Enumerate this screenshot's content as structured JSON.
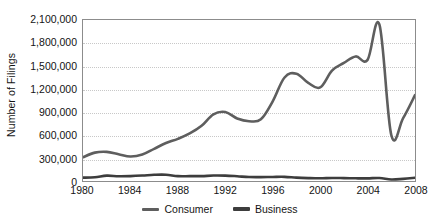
{
  "chart_data": {
    "type": "line",
    "title": "",
    "xlabel": "",
    "ylabel": "Number of Filings",
    "xlim": [
      1980,
      2008
    ],
    "ylim": [
      0,
      2100000
    ],
    "grid": true,
    "legend_position": "bottom-center",
    "x_ticks": [
      "1980",
      "1984",
      "1988",
      "1992",
      "1996",
      "2000",
      "2004",
      "2008"
    ],
    "x_tick_values": [
      1980,
      1984,
      1988,
      1992,
      1996,
      2000,
      2004,
      2008
    ],
    "y_ticks": [
      "0",
      "300,000",
      "600,000",
      "900,000",
      "1,200,000",
      "1,500,000",
      "1,800,000",
      "2,100,000"
    ],
    "y_tick_values": [
      0,
      300000,
      600000,
      900000,
      1200000,
      1500000,
      1800000,
      2100000
    ],
    "x": [
      1980,
      1981,
      1982,
      1983,
      1984,
      1985,
      1986,
      1987,
      1988,
      1989,
      1990,
      1991,
      1992,
      1993,
      1994,
      1995,
      1996,
      1997,
      1998,
      1999,
      2000,
      2001,
      2002,
      2003,
      2004,
      2005,
      2006,
      2007,
      2008
    ],
    "series": [
      {
        "name": "Consumer",
        "color": "#5e5e5e",
        "width": 2.6,
        "values": [
          310000,
          370000,
          380000,
          350000,
          320000,
          345000,
          420000,
          495000,
          550000,
          620000,
          720000,
          870000,
          900000,
          815000,
          780000,
          805000,
          1040000,
          1350000,
          1400000,
          1280000,
          1220000,
          1440000,
          1540000,
          1625000,
          1580000,
          2040000,
          600000,
          820000,
          1120000
        ]
      },
      {
        "name": "Business",
        "color": "#3d3d3d",
        "width": 2.6,
        "values": [
          44000,
          48000,
          70000,
          62000,
          64000,
          71000,
          81000,
          82000,
          63000,
          63000,
          64000,
          71000,
          70000,
          62000,
          52000,
          51000,
          53000,
          54000,
          44000,
          38000,
          35000,
          40000,
          38000,
          35000,
          34000,
          39000,
          19000,
          28000,
          43000
        ]
      }
    ]
  },
  "legend": {
    "items": [
      {
        "label": "Consumer",
        "color": "#5e5e5e",
        "thickness": 3
      },
      {
        "label": "Business",
        "color": "#3d3d3d",
        "thickness": 4
      }
    ]
  },
  "axis": {
    "y_title": "Number of Filings"
  }
}
